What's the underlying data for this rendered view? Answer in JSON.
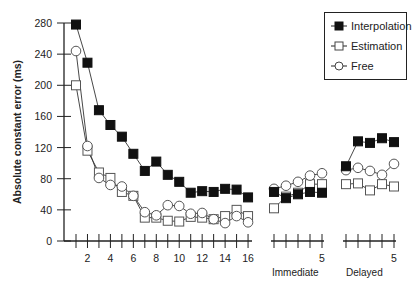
{
  "chart_data": {
    "type": "line",
    "title": "",
    "ylabel": "Absolute constant error (ms)",
    "ylim": [
      0,
      280
    ],
    "yticks": [
      0,
      40,
      80,
      120,
      160,
      200,
      240,
      280
    ],
    "legend": {
      "position": "upper right",
      "entries": [
        "Interpolation",
        "Estimation",
        "Free"
      ]
    },
    "grid": false,
    "panels": [
      {
        "name": "Training",
        "xlabel": "",
        "x": [
          1,
          2,
          3,
          4,
          5,
          6,
          7,
          8,
          9,
          10,
          11,
          12,
          13,
          14,
          15,
          16
        ],
        "xtick_labels": [
          "2",
          "4",
          "6",
          "8",
          "10",
          "12",
          "14",
          "16"
        ],
        "series": [
          {
            "name": "Interpolation",
            "marker": "filled-square",
            "values": [
              278,
              229,
              168,
              149,
              134,
              112,
              90,
              102,
              85,
              76,
              62,
              64,
              63,
              67,
              66,
              56
            ]
          },
          {
            "name": "Estimation",
            "marker": "open-square",
            "values": [
              200,
              116,
              88,
              81,
              63,
              58,
              30,
              30,
              26,
              25,
              31,
              30,
              28,
              32,
              40,
              32
            ]
          },
          {
            "name": "Free",
            "marker": "open-circle",
            "values": [
              244,
              122,
              81,
              72,
              70,
              58,
              37,
              33,
              46,
              45,
              35,
              36,
              28,
              23,
              32,
              24
            ]
          }
        ]
      },
      {
        "name": "Immediate",
        "xlabel": "Immediate",
        "x": [
          1,
          2,
          3,
          4,
          5
        ],
        "xtick_labels": [
          "5"
        ],
        "series": [
          {
            "name": "Interpolation",
            "marker": "filled-square",
            "values": [
              63,
              55,
              60,
              63,
              62
            ]
          },
          {
            "name": "Estimation",
            "marker": "open-square",
            "values": [
              42,
              57,
              62,
              73,
              73
            ]
          },
          {
            "name": "Free",
            "marker": "open-circle",
            "values": [
              67,
              71,
              76,
              84,
              87
            ]
          }
        ]
      },
      {
        "name": "Delayed",
        "xlabel": "Delayed",
        "x": [
          1,
          2,
          3,
          4,
          5
        ],
        "xtick_labels": [
          "5"
        ],
        "series": [
          {
            "name": "Interpolation",
            "marker": "filled-square",
            "values": [
              96,
              128,
              126,
              132,
              127
            ]
          },
          {
            "name": "Estimation",
            "marker": "open-square",
            "values": [
              73,
              74,
              65,
              73,
              70
            ]
          },
          {
            "name": "Free",
            "marker": "open-circle",
            "values": [
              91,
              94,
              90,
              85,
              99
            ]
          }
        ]
      }
    ]
  },
  "axis": {
    "ylabel": "Absolute constant error (ms)",
    "yticks": [
      "0",
      "40",
      "80",
      "120",
      "160",
      "200",
      "240",
      "280"
    ],
    "training_xticks": [
      "2",
      "4",
      "6",
      "8",
      "10",
      "12",
      "14",
      "16"
    ],
    "immediate_tick": "5",
    "delayed_tick": "5"
  },
  "legend": {
    "interpolation": "Interpolation",
    "estimation": "Estimation",
    "free": "Free"
  },
  "panels": {
    "immediate_label": "Immediate",
    "delayed_label": "Delayed"
  }
}
